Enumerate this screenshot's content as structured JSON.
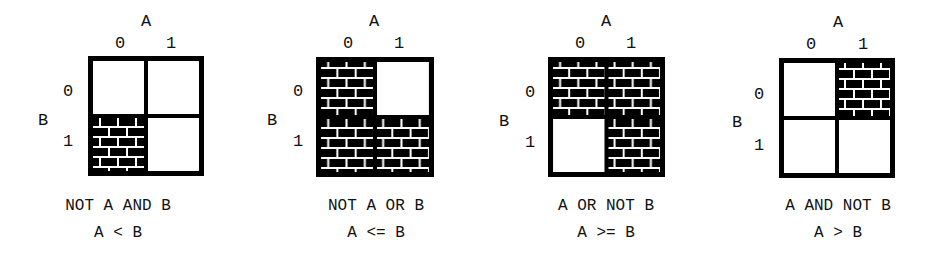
{
  "diagrams": [
    {
      "axis_a": "A",
      "axis_b": "B",
      "a_values": [
        "0",
        "1"
      ],
      "b_values": [
        "0",
        "1"
      ],
      "filled_cells": {
        "a0b0": false,
        "a1b0": false,
        "a0b1": true,
        "a1b1": false
      },
      "caption_expr": "NOT A AND B",
      "caption_rel": "A < B"
    },
    {
      "axis_a": "A",
      "axis_b": "B",
      "a_values": [
        "0",
        "1"
      ],
      "b_values": [
        "0",
        "1"
      ],
      "filled_cells": {
        "a0b0": true,
        "a1b0": false,
        "a0b1": true,
        "a1b1": true
      },
      "caption_expr": "NOT A OR B",
      "caption_rel": "A <= B"
    },
    {
      "axis_a": "A",
      "axis_b": "B",
      "a_values": [
        "0",
        "1"
      ],
      "b_values": [
        "0",
        "1"
      ],
      "filled_cells": {
        "a0b0": true,
        "a1b0": true,
        "a0b1": false,
        "a1b1": true
      },
      "caption_expr": "A OR NOT B",
      "caption_rel": "A >= B"
    },
    {
      "axis_a": "A",
      "axis_b": "B",
      "a_values": [
        "0",
        "1"
      ],
      "b_values": [
        "0",
        "1"
      ],
      "filled_cells": {
        "a0b0": false,
        "a1b0": true,
        "a0b1": false,
        "a1b1": false
      },
      "caption_expr": "A AND NOT B",
      "caption_rel": "A > B"
    }
  ],
  "style": {
    "fill_pattern": "brick",
    "ink_color": "#000000",
    "mortar_color": "#ffffff",
    "background": "#ffffff"
  }
}
